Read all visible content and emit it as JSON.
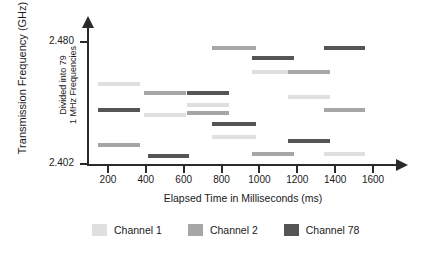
{
  "chart_data": {
    "type": "bar",
    "title": "",
    "xlabel": "Elapsed Time in Milliseconds (ms)",
    "ylabel": "Transmission Frequency (GHz)",
    "ylabel_secondary_line1": "Divided into 79",
    "ylabel_secondary_line2": "1 MHz Frequencies",
    "x_ticks": [
      "200",
      "400",
      "600",
      "800",
      "1000",
      "1200",
      "1400",
      "1600"
    ],
    "y_ticks": [
      "2.480",
      "2.402"
    ],
    "ylim": [
      2.402,
      2.48
    ],
    "xlim": [
      100,
      1700
    ],
    "grid": false,
    "legend_position": "bottom",
    "series": [
      {
        "name": "Channel 1",
        "color": "#dfdfdf"
      },
      {
        "name": "Channel 2",
        "color": "#a6a6a6"
      },
      {
        "name": "Channel 78",
        "color": "#555555"
      }
    ],
    "hops": [
      {
        "series": "Channel 1",
        "t_start": 150,
        "t_end": 370,
        "freq": 2.4534
      },
      {
        "series": "Channel 78",
        "t_start": 150,
        "t_end": 370,
        "freq": 2.4368
      },
      {
        "series": "Channel 2",
        "t_start": 150,
        "t_end": 370,
        "freq": 2.4144
      },
      {
        "series": "Channel 2",
        "t_start": 390,
        "t_end": 610,
        "freq": 2.4477
      },
      {
        "series": "Channel 1",
        "t_start": 390,
        "t_end": 610,
        "freq": 2.4336
      },
      {
        "series": "Channel 78",
        "t_start": 410,
        "t_end": 630,
        "freq": 2.4074
      },
      {
        "series": "Channel 78",
        "t_start": 620,
        "t_end": 840,
        "freq": 2.4477
      },
      {
        "series": "Channel 1",
        "t_start": 620,
        "t_end": 840,
        "freq": 2.44
      },
      {
        "series": "Channel 2",
        "t_start": 620,
        "t_end": 840,
        "freq": 2.4349
      },
      {
        "series": "Channel 2",
        "t_start": 750,
        "t_end": 980,
        "freq": 2.4762
      },
      {
        "series": "Channel 78",
        "t_start": 750,
        "t_end": 980,
        "freq": 2.4278
      },
      {
        "series": "Channel 1",
        "t_start": 750,
        "t_end": 980,
        "freq": 2.4195
      },
      {
        "series": "Channel 78",
        "t_start": 960,
        "t_end": 1180,
        "freq": 2.4698
      },
      {
        "series": "Channel 1",
        "t_start": 960,
        "t_end": 1180,
        "freq": 2.4608
      },
      {
        "series": "Channel 2",
        "t_start": 960,
        "t_end": 1180,
        "freq": 2.4086
      },
      {
        "series": "Channel 2",
        "t_start": 1150,
        "t_end": 1370,
        "freq": 2.4608
      },
      {
        "series": "Channel 1",
        "t_start": 1150,
        "t_end": 1370,
        "freq": 2.4451
      },
      {
        "series": "Channel 78",
        "t_start": 1150,
        "t_end": 1370,
        "freq": 2.417
      },
      {
        "series": "Channel 78",
        "t_start": 1340,
        "t_end": 1560,
        "freq": 2.4762
      },
      {
        "series": "Channel 2",
        "t_start": 1340,
        "t_end": 1560,
        "freq": 2.4368
      },
      {
        "series": "Channel 1",
        "t_start": 1340,
        "t_end": 1560,
        "freq": 2.4086
      }
    ]
  },
  "legend": {
    "items": [
      {
        "label": "Channel 1",
        "color": "#dfdfdf"
      },
      {
        "label": "Channel 2",
        "color": "#a6a6a6"
      },
      {
        "label": "Channel 78",
        "color": "#555555"
      }
    ]
  }
}
